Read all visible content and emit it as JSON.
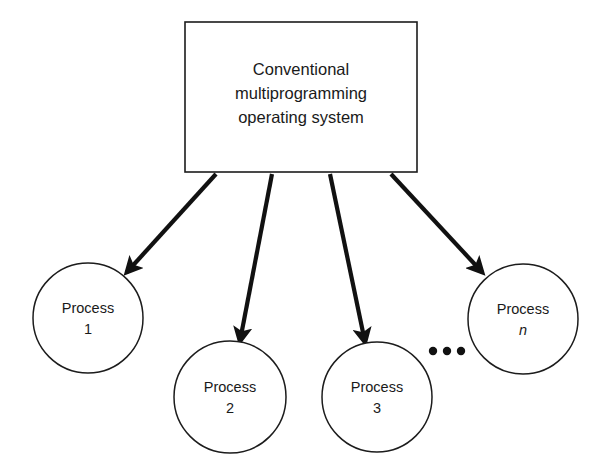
{
  "diagram": {
    "background_color": "#ffffff",
    "stroke_color": "#1c1c1c",
    "text_color": "#1a1a1a",
    "root_box": {
      "name": "conventional-multiprogramming-operating-system",
      "lines": [
        "Conventional",
        "multiprogramming",
        "operating system"
      ],
      "shape": "rectangle",
      "x": 185,
      "y": 22,
      "width": 232,
      "height": 150
    },
    "processes": [
      {
        "id": "process-1",
        "label": "Process",
        "index": "1",
        "index_italic": false,
        "cx": 88,
        "cy": 318,
        "r": 55
      },
      {
        "id": "process-2",
        "label": "Process",
        "index": "2",
        "index_italic": false,
        "cx": 230,
        "cy": 397,
        "r": 56
      },
      {
        "id": "process-3",
        "label": "Process",
        "index": "3",
        "index_italic": false,
        "cx": 377,
        "cy": 397,
        "r": 55
      },
      {
        "id": "process-n",
        "label": "Process",
        "index": "n",
        "index_italic": true,
        "cx": 523,
        "cy": 319,
        "r": 55
      }
    ],
    "arrows": [
      {
        "id": "arrow-to-process-1",
        "from": "root-box",
        "to": "process-1",
        "x1": 216,
        "y1": 174,
        "x2": 127,
        "y2": 272
      },
      {
        "id": "arrow-to-process-2",
        "from": "root-box",
        "to": "process-2",
        "x1": 272,
        "y1": 174,
        "x2": 240,
        "y2": 341
      },
      {
        "id": "arrow-to-process-3",
        "from": "root-box",
        "to": "process-3",
        "x1": 330,
        "y1": 174,
        "x2": 365,
        "y2": 342
      },
      {
        "id": "arrow-to-process-n",
        "from": "root-box",
        "to": "process-n",
        "x1": 391,
        "y1": 174,
        "x2": 482,
        "y2": 272
      }
    ],
    "ellipsis": {
      "name": "process-continuation-ellipsis",
      "dots": [
        {
          "cx": 433,
          "cy": 351,
          "r": 4.2
        },
        {
          "cx": 447,
          "cy": 351,
          "r": 4.2
        },
        {
          "cx": 461,
          "cy": 351,
          "r": 4.2
        }
      ]
    }
  }
}
